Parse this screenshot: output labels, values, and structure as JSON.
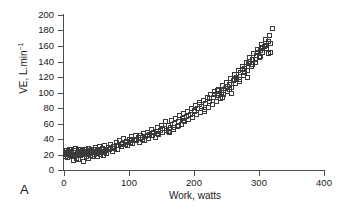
{
  "panel": {
    "label": "A"
  },
  "chart_data": {
    "type": "scatter",
    "title": "",
    "xlabel": "Work, watts",
    "ylabel": "VE, L.min",
    "ylabel_exponent": "−1",
    "xlim": [
      0,
      400
    ],
    "ylim": [
      0,
      200
    ],
    "xticks": [
      0,
      100,
      200,
      300,
      400
    ],
    "yticks": [
      0,
      20,
      40,
      60,
      80,
      100,
      120,
      140,
      160,
      180,
      200
    ],
    "grid": false,
    "legend": null,
    "marker": "open-square",
    "marker_color": "#3a3a3a",
    "n_points": 212,
    "points": [
      [
        2,
        22
      ],
      [
        3,
        18
      ],
      [
        4,
        25
      ],
      [
        5,
        21
      ],
      [
        6,
        16
      ],
      [
        7,
        24
      ],
      [
        8,
        20
      ],
      [
        9,
        27
      ],
      [
        10,
        19
      ],
      [
        11,
        23
      ],
      [
        12,
        26
      ],
      [
        13,
        17
      ],
      [
        14,
        22
      ],
      [
        15,
        12
      ],
      [
        16,
        25
      ],
      [
        17,
        20
      ],
      [
        18,
        28
      ],
      [
        19,
        15
      ],
      [
        20,
        23
      ],
      [
        21,
        21
      ],
      [
        22,
        26
      ],
      [
        23,
        13
      ],
      [
        24,
        24
      ],
      [
        25,
        19
      ],
      [
        26,
        27
      ],
      [
        27,
        22
      ],
      [
        28,
        16
      ],
      [
        29,
        25
      ],
      [
        30,
        11
      ],
      [
        31,
        23
      ],
      [
        32,
        20
      ],
      [
        33,
        26
      ],
      [
        34,
        18
      ],
      [
        35,
        24
      ],
      [
        36,
        22
      ],
      [
        37,
        28
      ],
      [
        38,
        15
      ],
      [
        39,
        21
      ],
      [
        40,
        25
      ],
      [
        41,
        19
      ],
      [
        42,
        27
      ],
      [
        43,
        23
      ],
      [
        44,
        17
      ],
      [
        45,
        26
      ],
      [
        46,
        22
      ],
      [
        47,
        20
      ],
      [
        48,
        29
      ],
      [
        49,
        24
      ],
      [
        50,
        21
      ],
      [
        51,
        27
      ],
      [
        52,
        18
      ],
      [
        53,
        25
      ],
      [
        54,
        23
      ],
      [
        55,
        30
      ],
      [
        56,
        20
      ],
      [
        57,
        26
      ],
      [
        58,
        22
      ],
      [
        59,
        28
      ],
      [
        60,
        19
      ],
      [
        61,
        24
      ],
      [
        62,
        31
      ],
      [
        63,
        23
      ],
      [
        64,
        27
      ],
      [
        65,
        21
      ],
      [
        68,
        29
      ],
      [
        70,
        26
      ],
      [
        72,
        33
      ],
      [
        74,
        24
      ],
      [
        76,
        30
      ],
      [
        78,
        28
      ],
      [
        80,
        35
      ],
      [
        82,
        27
      ],
      [
        84,
        32
      ],
      [
        86,
        38
      ],
      [
        88,
        30
      ],
      [
        90,
        34
      ],
      [
        92,
        41
      ],
      [
        94,
        33
      ],
      [
        96,
        37
      ],
      [
        98,
        31
      ],
      [
        100,
        40
      ],
      [
        102,
        36
      ],
      [
        104,
        43
      ],
      [
        106,
        34
      ],
      [
        108,
        39
      ],
      [
        110,
        45
      ],
      [
        112,
        38
      ],
      [
        114,
        42
      ],
      [
        116,
        36
      ],
      [
        118,
        44
      ],
      [
        120,
        40
      ],
      [
        122,
        47
      ],
      [
        124,
        38
      ],
      [
        126,
        43
      ],
      [
        128,
        49
      ],
      [
        130,
        41
      ],
      [
        132,
        46
      ],
      [
        134,
        52
      ],
      [
        136,
        44
      ],
      [
        138,
        48
      ],
      [
        140,
        42
      ],
      [
        142,
        50
      ],
      [
        144,
        55
      ],
      [
        146,
        46
      ],
      [
        148,
        51
      ],
      [
        150,
        58
      ],
      [
        152,
        49
      ],
      [
        154,
        53
      ],
      [
        156,
        62
      ],
      [
        158,
        51
      ],
      [
        160,
        57
      ],
      [
        162,
        48
      ],
      [
        164,
        55
      ],
      [
        166,
        64
      ],
      [
        168,
        52
      ],
      [
        170,
        60
      ],
      [
        172,
        67
      ],
      [
        174,
        56
      ],
      [
        176,
        63
      ],
      [
        178,
        70
      ],
      [
        180,
        59
      ],
      [
        182,
        66
      ],
      [
        184,
        73
      ],
      [
        186,
        62
      ],
      [
        188,
        69
      ],
      [
        190,
        76
      ],
      [
        192,
        65
      ],
      [
        194,
        72
      ],
      [
        196,
        80
      ],
      [
        198,
        68
      ],
      [
        200,
        75
      ],
      [
        202,
        83
      ],
      [
        204,
        71
      ],
      [
        206,
        79
      ],
      [
        208,
        87
      ],
      [
        210,
        74
      ],
      [
        212,
        82
      ],
      [
        214,
        90
      ],
      [
        216,
        78
      ],
      [
        218,
        86
      ],
      [
        220,
        94
      ],
      [
        222,
        81
      ],
      [
        224,
        89
      ],
      [
        226,
        97
      ],
      [
        228,
        85
      ],
      [
        230,
        93
      ],
      [
        232,
        101
      ],
      [
        234,
        88
      ],
      [
        236,
        96
      ],
      [
        238,
        104
      ],
      [
        240,
        92
      ],
      [
        242,
        100
      ],
      [
        244,
        109
      ],
      [
        246,
        97
      ],
      [
        248,
        105
      ],
      [
        250,
        113
      ],
      [
        252,
        101
      ],
      [
        254,
        110
      ],
      [
        256,
        118
      ],
      [
        258,
        106
      ],
      [
        260,
        115
      ],
      [
        262,
        123
      ],
      [
        264,
        111
      ],
      [
        266,
        120
      ],
      [
        268,
        128
      ],
      [
        270,
        117
      ],
      [
        272,
        126
      ],
      [
        274,
        134
      ],
      [
        276,
        122
      ],
      [
        278,
        131
      ],
      [
        280,
        139
      ],
      [
        282,
        128
      ],
      [
        284,
        137
      ],
      [
        286,
        145
      ],
      [
        288,
        133
      ],
      [
        290,
        142
      ],
      [
        292,
        150
      ],
      [
        294,
        139
      ],
      [
        296,
        148
      ],
      [
        298,
        156
      ],
      [
        300,
        145
      ],
      [
        302,
        154
      ],
      [
        304,
        162
      ],
      [
        306,
        151
      ],
      [
        308,
        160
      ],
      [
        310,
        168
      ],
      [
        312,
        157
      ],
      [
        314,
        166
      ],
      [
        316,
        174
      ],
      [
        318,
        163
      ],
      [
        320,
        182
      ],
      [
        230,
        94
      ],
      [
        236,
        103
      ],
      [
        244,
        93
      ],
      [
        252,
        108
      ],
      [
        258,
        99
      ],
      [
        266,
        118
      ],
      [
        274,
        130
      ],
      [
        282,
        120
      ],
      [
        290,
        136
      ],
      [
        298,
        151
      ],
      [
        306,
        158
      ],
      [
        314,
        150
      ],
      [
        318,
        152
      ],
      [
        310,
        161
      ],
      [
        302,
        147
      ],
      [
        294,
        143
      ],
      [
        286,
        140
      ],
      [
        278,
        126
      ],
      [
        270,
        114
      ],
      [
        262,
        117
      ],
      [
        254,
        104
      ],
      [
        246,
        102
      ],
      [
        238,
        99
      ],
      [
        160,
        50
      ],
      [
        168,
        55
      ],
      [
        176,
        58
      ],
      [
        184,
        64
      ],
      [
        192,
        70
      ],
      [
        200,
        77
      ],
      [
        208,
        84
      ],
      [
        216,
        76
      ],
      [
        224,
        92
      ],
      [
        232,
        98
      ],
      [
        144,
        47
      ],
      [
        152,
        54
      ],
      [
        136,
        45
      ],
      [
        128,
        44
      ],
      [
        120,
        42
      ],
      [
        112,
        40
      ],
      [
        104,
        38
      ],
      [
        96,
        36
      ],
      [
        88,
        33
      ],
      [
        80,
        31
      ],
      [
        72,
        28
      ],
      [
        64,
        25
      ],
      [
        56,
        24
      ],
      [
        48,
        22
      ],
      [
        40,
        23
      ],
      [
        32,
        21
      ],
      [
        24,
        20
      ],
      [
        16,
        19
      ],
      [
        8,
        22
      ],
      [
        4,
        20
      ]
    ]
  }
}
